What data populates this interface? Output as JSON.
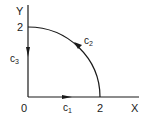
{
  "diagram": {
    "axes": {
      "x_label": "X",
      "y_label": "Y",
      "origin_label": "0",
      "x_tick_label": "2",
      "y_tick_label": "2"
    },
    "curves": [
      {
        "id": "c1",
        "base": "c",
        "sub": "1",
        "description": "segment along X axis from 0 to 2, arrow pointing right"
      },
      {
        "id": "c2",
        "base": "c",
        "sub": "2",
        "description": "quarter circle arc of radius 2 from (2,0) to (0,2), arrow counterclockwise"
      },
      {
        "id": "c3",
        "base": "c",
        "sub": "3",
        "description": "segment along Y axis from 2 to 0, arrow pointing down"
      }
    ],
    "stroke_color": "#1a1a1a",
    "background": "#ffffff"
  }
}
